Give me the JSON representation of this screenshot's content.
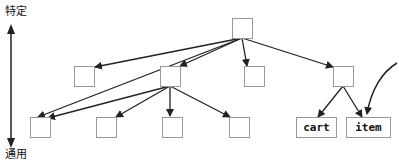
{
  "axis": {
    "top_label": "特定",
    "bottom_label": "通用"
  },
  "nodes": {
    "root": "",
    "level1": [
      "",
      "",
      "",
      ""
    ],
    "level2": [
      "",
      "",
      "",
      ""
    ],
    "cart": "cart",
    "item": "item"
  },
  "colors": {
    "line": "#222222",
    "box_border": "#999999"
  }
}
